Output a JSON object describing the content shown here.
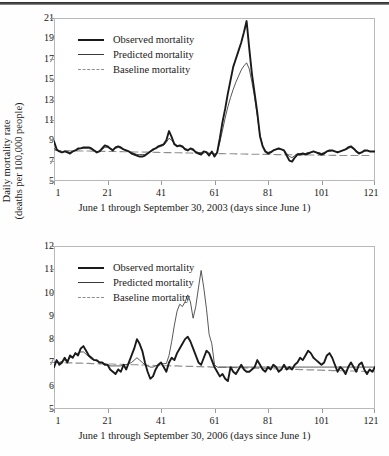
{
  "figure": {
    "panels": [
      {
        "id": "panel-2003",
        "ylabel_line1": "Daily mortality rate",
        "ylabel_line2": "(deaths per 100,000 people)",
        "xlabel": "June 1 through September 30, 2003 (days since June 1)",
        "yticks": [
          5,
          7,
          9,
          11,
          13,
          15,
          17,
          19,
          21
        ],
        "xticks": [
          1,
          21,
          41,
          61,
          81,
          101,
          121
        ],
        "legend": [
          {
            "label": "Observed mortality",
            "key": "solid-thick",
            "color": "#1a1a1a"
          },
          {
            "label": "Predicted mortality",
            "key": "solid-thin",
            "color": "#3a3a3a"
          },
          {
            "label": "Baseline mortality",
            "key": "dashed",
            "color": "#8f8f8f"
          }
        ]
      },
      {
        "id": "panel-2006",
        "ylabel_line1": "Daily mortality rate",
        "ylabel_line2": "(deaths per 100,000 people)",
        "xlabel": "June 1 through September 30, 2006 (days since June 1)",
        "yticks": [
          5,
          6,
          7,
          8,
          9,
          10,
          11,
          12
        ],
        "xticks": [
          1,
          21,
          41,
          61,
          81,
          101,
          121
        ],
        "legend": [
          {
            "label": "Observed mortality",
            "key": "solid-thick",
            "color": "#1a1a1a"
          },
          {
            "label": "Predicted mortality",
            "key": "solid-thin",
            "color": "#3a3a3a"
          },
          {
            "label": "Baseline mortality",
            "key": "dashed",
            "color": "#8f8f8f"
          }
        ]
      }
    ]
  },
  "chart_data": [
    {
      "type": "line",
      "title": "",
      "xlabel": "June 1 through September 30, 2003 (days since June 1)",
      "ylabel": "Daily mortality rate (deaths per 100,000 people)",
      "xlim": [
        1,
        121
      ],
      "ylim": [
        5,
        21
      ],
      "grid": false,
      "legend_position": "top-left",
      "x": [
        1,
        2,
        3,
        4,
        5,
        6,
        7,
        8,
        9,
        10,
        11,
        12,
        13,
        14,
        15,
        16,
        17,
        18,
        19,
        20,
        21,
        22,
        23,
        24,
        25,
        26,
        27,
        28,
        29,
        30,
        31,
        32,
        33,
        34,
        35,
        36,
        37,
        38,
        39,
        40,
        41,
        42,
        43,
        44,
        45,
        46,
        47,
        48,
        49,
        50,
        51,
        52,
        53,
        54,
        55,
        56,
        57,
        58,
        59,
        60,
        61,
        62,
        63,
        64,
        65,
        66,
        67,
        68,
        69,
        70,
        71,
        72,
        73,
        74,
        75,
        76,
        77,
        78,
        79,
        80,
        81,
        82,
        83,
        84,
        85,
        86,
        87,
        88,
        89,
        90,
        91,
        92,
        93,
        94,
        95,
        96,
        97,
        98,
        99,
        100,
        101,
        102,
        103,
        104,
        105,
        106,
        107,
        108,
        109,
        110,
        111,
        112,
        113,
        114,
        115,
        116,
        117,
        118,
        119,
        120,
        121
      ],
      "series": [
        {
          "name": "Observed mortality",
          "color": "#1a1a1a",
          "style": "solid-thick",
          "values": [
            8.9,
            8.1,
            7.9,
            7.8,
            7.9,
            7.8,
            7.7,
            7.9,
            8.0,
            8.2,
            8.2,
            8.3,
            8.3,
            8.3,
            8.2,
            8.0,
            7.8,
            7.9,
            8.2,
            8.5,
            8.4,
            8.2,
            8.0,
            8.3,
            8.4,
            8.3,
            8.1,
            8.0,
            7.9,
            7.7,
            7.6,
            7.5,
            7.4,
            7.4,
            7.5,
            7.7,
            7.9,
            8.1,
            8.2,
            8.4,
            8.5,
            8.6,
            9.0,
            9.9,
            9.3,
            8.6,
            8.4,
            8.5,
            8.4,
            8.1,
            8.0,
            8.2,
            8.1,
            7.8,
            7.7,
            7.6,
            7.9,
            7.8,
            7.5,
            7.9,
            7.4,
            7.8,
            9.2,
            10.8,
            12.1,
            13.6,
            14.9,
            16.2,
            17.0,
            17.8,
            18.6,
            19.6,
            20.7,
            18.0,
            15.5,
            13.6,
            11.7,
            9.4,
            8.4,
            7.9,
            7.7,
            7.8,
            8.0,
            8.1,
            8.2,
            8.1,
            8.0,
            7.5,
            7.0,
            6.9,
            7.3,
            7.6,
            7.6,
            7.7,
            7.6,
            7.7,
            7.8,
            7.9,
            7.8,
            7.7,
            7.6,
            7.7,
            7.9,
            8.0,
            8.0,
            7.9,
            7.8,
            7.9,
            8.0,
            8.1,
            8.3,
            8.4,
            8.2,
            7.9,
            7.7,
            7.8,
            8.0,
            8.0,
            7.9,
            7.9,
            7.9
          ]
        },
        {
          "name": "Predicted mortality",
          "color": "#3a3a3a",
          "style": "solid-thin",
          "values": [
            8.2,
            8.0,
            7.9,
            7.8,
            7.9,
            7.9,
            7.8,
            7.9,
            8.0,
            8.1,
            8.2,
            8.2,
            8.2,
            8.2,
            8.1,
            8.0,
            7.9,
            7.9,
            8.1,
            8.3,
            8.3,
            8.2,
            8.1,
            8.2,
            8.3,
            8.2,
            8.1,
            8.0,
            7.9,
            7.8,
            7.7,
            7.6,
            7.6,
            7.6,
            7.6,
            7.7,
            7.9,
            8.0,
            8.2,
            8.3,
            8.4,
            8.5,
            8.8,
            9.2,
            9.0,
            8.7,
            8.5,
            8.4,
            8.3,
            8.2,
            8.1,
            8.1,
            8.0,
            7.9,
            7.8,
            7.8,
            7.9,
            7.9,
            7.7,
            7.8,
            7.6,
            7.8,
            8.8,
            10.0,
            11.2,
            12.3,
            13.2,
            14.0,
            14.7,
            15.3,
            15.9,
            16.3,
            16.6,
            16.0,
            14.7,
            13.2,
            11.4,
            9.5,
            8.5,
            8.0,
            7.8,
            7.9,
            8.0,
            8.1,
            8.1,
            8.1,
            8.0,
            7.7,
            7.4,
            7.3,
            7.5,
            7.7,
            7.7,
            7.7,
            7.7,
            7.8,
            7.8,
            7.9,
            7.8,
            7.8,
            7.7,
            7.8,
            7.9,
            7.9,
            8.0,
            7.9,
            7.9,
            7.9,
            8.0,
            8.1,
            8.2,
            8.3,
            8.1,
            8.0,
            7.8,
            7.8,
            7.9,
            8.0,
            7.9,
            7.9,
            7.9
          ]
        },
        {
          "name": "Baseline mortality",
          "color": "#8f8f8f",
          "style": "dashed",
          "values": [
            8.0,
            8.0,
            7.99,
            7.99,
            7.98,
            7.98,
            7.97,
            7.97,
            7.96,
            7.96,
            7.95,
            7.95,
            7.94,
            7.94,
            7.93,
            7.93,
            7.92,
            7.92,
            7.91,
            7.91,
            7.9,
            7.9,
            7.89,
            7.89,
            7.88,
            7.88,
            7.87,
            7.87,
            7.86,
            7.86,
            7.85,
            7.85,
            7.84,
            7.84,
            7.83,
            7.83,
            7.82,
            7.82,
            7.81,
            7.81,
            7.8,
            7.8,
            7.79,
            7.79,
            7.78,
            7.78,
            7.77,
            7.77,
            7.76,
            7.76,
            7.75,
            7.75,
            7.74,
            7.74,
            7.73,
            7.73,
            7.72,
            7.72,
            7.71,
            7.71,
            7.7,
            7.7,
            7.69,
            7.69,
            7.68,
            7.68,
            7.67,
            7.67,
            7.66,
            7.66,
            7.65,
            7.65,
            7.64,
            7.64,
            7.63,
            7.63,
            7.62,
            7.62,
            7.61,
            7.61,
            7.6,
            7.6,
            7.6,
            7.59,
            7.59,
            7.59,
            7.58,
            7.58,
            7.58,
            7.57,
            7.57,
            7.57,
            7.56,
            7.56,
            7.56,
            7.55,
            7.55,
            7.55,
            7.54,
            7.54,
            7.54,
            7.53,
            7.53,
            7.53,
            7.52,
            7.52,
            7.52,
            7.51,
            7.51,
            7.51,
            7.5,
            7.5,
            7.5,
            7.5,
            7.5,
            7.5,
            7.5,
            7.5,
            7.5
          ]
        }
      ]
    },
    {
      "type": "line",
      "title": "",
      "xlabel": "June 1 through September 30, 2006 (days since June 1)",
      "ylabel": "Daily mortality rate (deaths per 100,000 people)",
      "xlim": [
        1,
        121
      ],
      "ylim": [
        5,
        12
      ],
      "grid": false,
      "legend_position": "top-left",
      "x": [
        1,
        2,
        3,
        4,
        5,
        6,
        7,
        8,
        9,
        10,
        11,
        12,
        13,
        14,
        15,
        16,
        17,
        18,
        19,
        20,
        21,
        22,
        23,
        24,
        25,
        26,
        27,
        28,
        29,
        30,
        31,
        32,
        33,
        34,
        35,
        36,
        37,
        38,
        39,
        40,
        41,
        42,
        43,
        44,
        45,
        46,
        47,
        48,
        49,
        50,
        51,
        52,
        53,
        54,
        55,
        56,
        57,
        58,
        59,
        60,
        61,
        62,
        63,
        64,
        65,
        66,
        67,
        68,
        69,
        70,
        71,
        72,
        73,
        74,
        75,
        76,
        77,
        78,
        79,
        80,
        81,
        82,
        83,
        84,
        85,
        86,
        87,
        88,
        89,
        90,
        91,
        92,
        93,
        94,
        95,
        96,
        97,
        98,
        99,
        100,
        101,
        102,
        103,
        104,
        105,
        106,
        107,
        108,
        109,
        110,
        111,
        112,
        113,
        114,
        115,
        116,
        117,
        118,
        119,
        120,
        121
      ],
      "series": [
        {
          "name": "Observed mortality",
          "color": "#1a1a1a",
          "style": "solid-thick",
          "values": [
            6.8,
            7.1,
            6.9,
            7.0,
            7.2,
            7.0,
            7.3,
            7.2,
            7.4,
            7.3,
            7.6,
            7.7,
            7.5,
            7.3,
            7.2,
            7.1,
            7.1,
            7.0,
            7.0,
            6.9,
            6.9,
            6.7,
            6.6,
            6.5,
            6.7,
            6.6,
            6.9,
            6.7,
            7.0,
            7.3,
            7.6,
            8.0,
            7.8,
            7.5,
            7.0,
            6.6,
            6.3,
            6.4,
            6.7,
            6.9,
            7.0,
            6.8,
            6.6,
            7.0,
            7.2,
            7.1,
            7.4,
            7.6,
            7.8,
            8.0,
            8.1,
            7.9,
            7.6,
            7.3,
            7.0,
            6.9,
            7.2,
            7.5,
            7.4,
            7.1,
            6.8,
            6.6,
            6.4,
            6.5,
            6.3,
            6.2,
            6.8,
            6.6,
            6.5,
            6.7,
            6.9,
            6.7,
            6.6,
            6.6,
            6.7,
            6.8,
            7.1,
            6.9,
            6.7,
            6.6,
            6.8,
            6.7,
            6.9,
            6.8,
            6.6,
            6.7,
            6.9,
            6.7,
            6.8,
            6.7,
            6.9,
            7.0,
            7.2,
            7.1,
            7.3,
            7.5,
            7.4,
            7.2,
            7.1,
            7.0,
            6.9,
            7.0,
            7.3,
            7.4,
            7.2,
            6.9,
            6.6,
            6.8,
            6.7,
            6.5,
            6.8,
            7.0,
            6.8,
            6.6,
            6.9,
            7.0,
            6.7,
            6.5,
            6.7,
            6.6,
            6.8
          ]
        },
        {
          "name": "Predicted mortality",
          "color": "#3a3a3a",
          "style": "solid-thin",
          "values": [
            7.0,
            7.05,
            7.0,
            7.05,
            7.1,
            7.1,
            7.2,
            7.25,
            7.35,
            7.4,
            7.45,
            7.45,
            7.35,
            7.25,
            7.15,
            7.1,
            7.05,
            7.0,
            7.0,
            6.95,
            6.9,
            6.85,
            6.85,
            6.85,
            6.85,
            6.85,
            6.9,
            6.9,
            6.95,
            7.0,
            7.1,
            7.2,
            7.1,
            7.0,
            6.9,
            6.85,
            6.8,
            6.8,
            6.85,
            6.9,
            6.95,
            6.95,
            6.95,
            7.3,
            7.9,
            8.6,
            9.2,
            9.5,
            9.4,
            9.6,
            9.9,
            9.6,
            8.9,
            9.4,
            10.2,
            10.95,
            10.2,
            9.3,
            8.2,
            7.8,
            6.9,
            6.8,
            6.8,
            6.8,
            6.8,
            6.8,
            6.8,
            6.8,
            6.8,
            6.8,
            6.8,
            6.8,
            6.8,
            6.8,
            6.8,
            6.8,
            6.8,
            6.8,
            6.8,
            6.8,
            6.8,
            6.8,
            6.8,
            6.8,
            6.8,
            6.8,
            6.8,
            6.8,
            6.8,
            6.8,
            6.8,
            6.8,
            6.8,
            6.8,
            6.8,
            6.8,
            6.8,
            6.8,
            6.8,
            6.8,
            6.8,
            6.8,
            6.8,
            6.8,
            6.8,
            6.8,
            6.8,
            6.8,
            6.8,
            6.8,
            6.8,
            6.8,
            6.8,
            6.8,
            6.8,
            6.8,
            6.8,
            6.8,
            6.8,
            6.8,
            6.8
          ]
        },
        {
          "name": "Baseline mortality",
          "color": "#8f8f8f",
          "style": "dashed",
          "values": [
            7.0,
            7.0,
            6.99,
            6.99,
            6.99,
            6.98,
            6.98,
            6.98,
            6.97,
            6.97,
            6.97,
            6.96,
            6.96,
            6.96,
            6.95,
            6.95,
            6.95,
            6.94,
            6.94,
            6.94,
            6.93,
            6.93,
            6.93,
            6.92,
            6.92,
            6.92,
            6.91,
            6.91,
            6.91,
            6.9,
            6.9,
            6.9,
            6.89,
            6.89,
            6.89,
            6.88,
            6.88,
            6.88,
            6.87,
            6.87,
            6.87,
            6.86,
            6.86,
            6.86,
            6.85,
            6.85,
            6.85,
            6.84,
            6.84,
            6.84,
            6.83,
            6.83,
            6.83,
            6.82,
            6.82,
            6.82,
            6.81,
            6.81,
            6.81,
            6.8,
            6.8,
            6.8,
            6.79,
            6.79,
            6.79,
            6.78,
            6.78,
            6.78,
            6.77,
            6.77,
            6.77,
            6.76,
            6.76,
            6.76,
            6.75,
            6.75,
            6.75,
            6.74,
            6.74,
            6.74,
            6.73,
            6.73,
            6.73,
            6.72,
            6.72,
            6.72,
            6.71,
            6.71,
            6.71,
            6.7,
            6.7,
            6.7,
            6.69,
            6.69,
            6.69,
            6.68,
            6.68,
            6.68,
            6.67,
            6.67,
            6.67,
            6.66,
            6.66,
            6.66,
            6.65,
            6.65,
            6.65,
            6.64,
            6.64,
            6.64,
            6.63,
            6.63,
            6.63,
            6.62,
            6.62,
            6.62,
            6.61,
            6.61,
            6.61,
            6.6,
            6.6
          ]
        }
      ]
    }
  ]
}
